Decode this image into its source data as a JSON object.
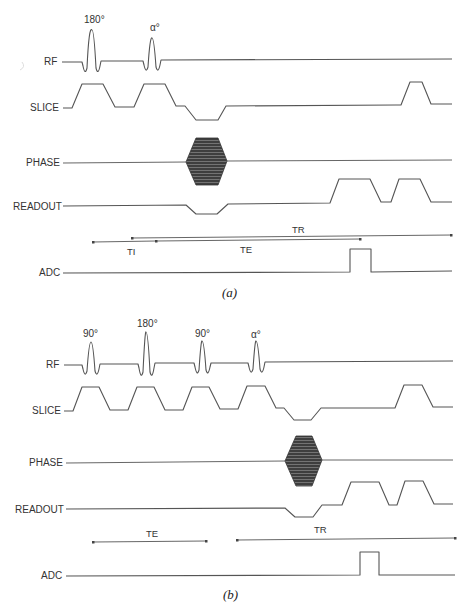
{
  "figure": {
    "panels": [
      {
        "id": "a",
        "caption": "(a)",
        "rows": {
          "rf": "RF",
          "slice": "SLICE",
          "phase": "PHASE",
          "readout": "READOUT",
          "adc": "ADC"
        },
        "rf_pulses": [
          {
            "label": "180°",
            "type": "inversion"
          },
          {
            "label": "α°",
            "type": "excitation"
          }
        ],
        "intervals": {
          "ti": "TI",
          "te": "TE",
          "tr": "TR"
        }
      },
      {
        "id": "b",
        "caption": "(b)",
        "rows": {
          "rf": "RF",
          "slice": "SLICE",
          "phase": "PHASE",
          "readout": "READOUT",
          "adc": "ADC"
        },
        "rf_pulses": [
          {
            "label": "90°",
            "type": "excitation"
          },
          {
            "label": "180°",
            "type": "refocusing"
          },
          {
            "label": "90°",
            "type": "restore"
          },
          {
            "label": "α°",
            "type": "excitation"
          }
        ],
        "intervals": {
          "te": "TE",
          "tr": "TR"
        }
      }
    ],
    "colors": {
      "line": "#555555",
      "text": "#333333",
      "phase_fill": "#4a4a4a",
      "background": "#ffffff"
    }
  }
}
